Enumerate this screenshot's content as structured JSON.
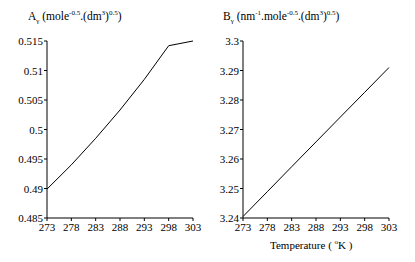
{
  "chart_data": [
    {
      "type": "line",
      "title": "Aγ (mole^-0.5.(dm^3)^0.5)",
      "title_parts": {
        "main": "A",
        "sub": "γ",
        "open": " (mole",
        "exp1": "-0.5",
        "mid": ".(dm",
        "exp2": "3",
        "close1": ")",
        "exp3": "0.5",
        "close2": ")"
      },
      "xlabel": "",
      "ylabel": "",
      "x": [
        273,
        278,
        283,
        288,
        293,
        298,
        303
      ],
      "series": [
        {
          "name": "A_gamma",
          "values": [
            0.4899,
            0.4944,
            0.4993,
            0.5043,
            0.5094,
            0.5146,
            0.515
          ]
        }
      ],
      "xticks": [
        "273",
        "278",
        "283",
        "288",
        "293",
        "298",
        "303"
      ],
      "yticks": [
        "0.485",
        "0.49",
        "0.495",
        "0.5",
        "0.505",
        "0.51",
        "0.515"
      ],
      "xlim": [
        273,
        303
      ],
      "ylim": [
        0.485,
        0.515
      ],
      "grid": false,
      "legend": "none"
    },
    {
      "type": "line",
      "title": "Bγ (nm^-1.mole^-0.5.(dm^3)^0.5)",
      "title_parts": {
        "main": "B",
        "sub": "γ",
        "open": " (nm",
        "exp0": "-1",
        "mid0": ".mole",
        "exp1": "-0.5",
        "mid": ".(dm",
        "exp2": "3",
        "close1": ")",
        "exp3": "0.5",
        "close2": ")"
      },
      "xlabel": "Temperature ( °K )",
      "xlabel_parts": {
        "a": "Temperature ( ",
        "sup": "o",
        "b": "K )"
      },
      "ylabel": "",
      "x": [
        273,
        278,
        283,
        288,
        293,
        298,
        303
      ],
      "series": [
        {
          "name": "B_gamma",
          "values": [
            3.2405,
            3.2489,
            3.2574,
            3.2658,
            3.2742,
            3.2826,
            3.291
          ]
        }
      ],
      "xticks": [
        "273",
        "278",
        "283",
        "288",
        "293",
        "298",
        "303"
      ],
      "yticks": [
        "3.24",
        "3.25",
        "3.26",
        "3.27",
        "3.28",
        "3.29",
        "3.3"
      ],
      "xlim": [
        273,
        303
      ],
      "ylim": [
        3.24,
        3.3
      ],
      "grid": false,
      "legend": "none"
    }
  ],
  "colors": {
    "line": "#000000",
    "axis": "#000000",
    "background": "#ffffff"
  }
}
